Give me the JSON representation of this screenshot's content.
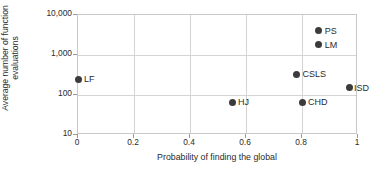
{
  "chart_data": {
    "type": "scatter",
    "title": "",
    "xlabel": "Probability of finding the global",
    "ylabel_line1": "Average number of function",
    "ylabel_line2": "evaluations",
    "xlim": [
      0,
      1
    ],
    "ylim": [
      10,
      10000
    ],
    "yscale": "log",
    "xscale": "linear",
    "grid": true,
    "legend": "none (points labelled inline)",
    "xticks": [
      "0",
      "0.2",
      "0.4",
      "0.6",
      "0.8",
      "1"
    ],
    "xtick_values": [
      0,
      0.2,
      0.4,
      0.6,
      0.8,
      1
    ],
    "yticks": [
      "10",
      "100",
      "1,000",
      "10,000"
    ],
    "ytick_values": [
      10,
      100,
      1000,
      10000
    ],
    "marker_color": "#3b3b3b",
    "grid_color": "#d4d4d4",
    "points": [
      {
        "label": "LF",
        "x": 0.0,
        "y": 250
      },
      {
        "label": "HJ",
        "x": 0.55,
        "y": 65
      },
      {
        "label": "CSLS",
        "x": 0.78,
        "y": 330
      },
      {
        "label": "CHD",
        "x": 0.8,
        "y": 65
      },
      {
        "label": "LM",
        "x": 0.86,
        "y": 1800
      },
      {
        "label": "PS",
        "x": 0.86,
        "y": 4000
      },
      {
        "label": "ISD",
        "x": 0.97,
        "y": 150
      }
    ]
  }
}
